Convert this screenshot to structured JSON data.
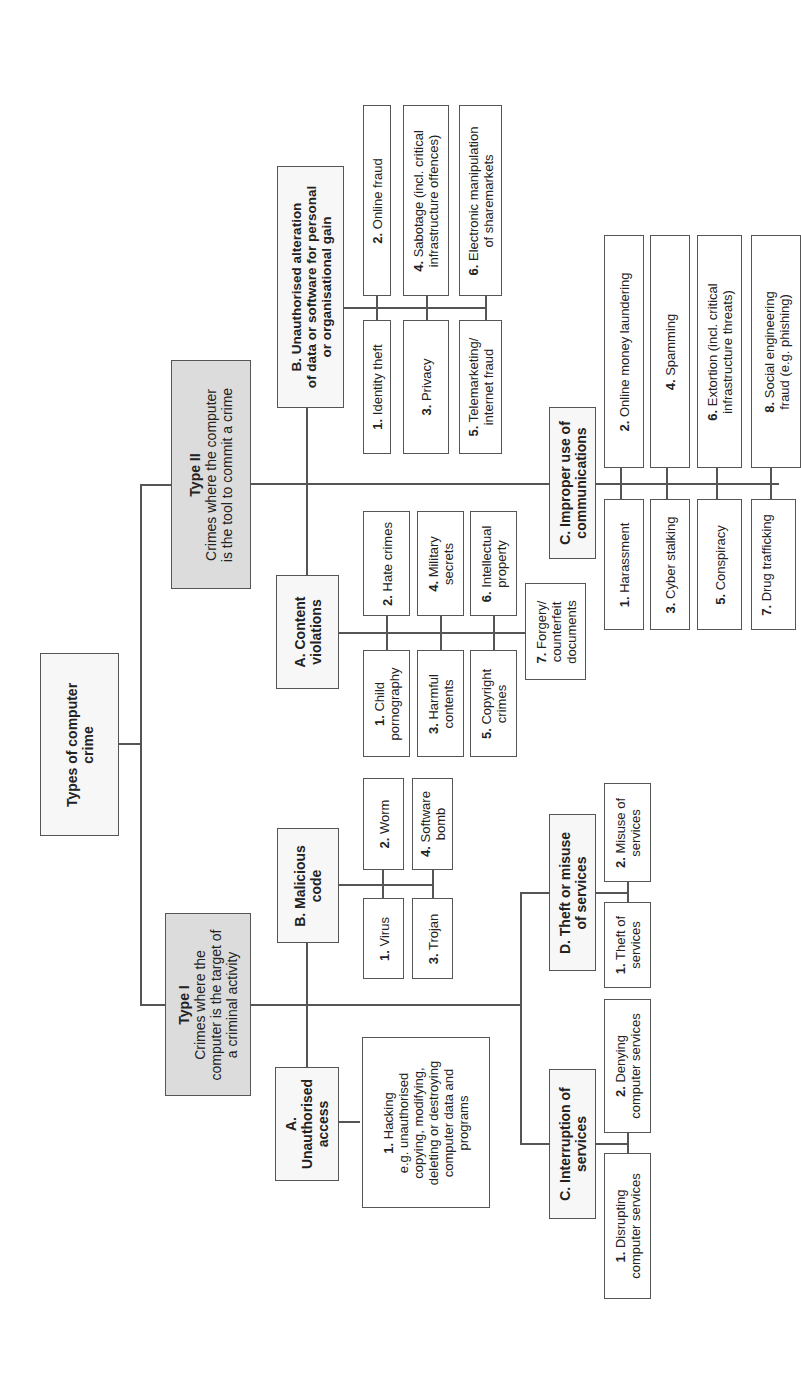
{
  "root": {
    "title": "Types of computer crime",
    "lines": [
      "Types of computer",
      "crime"
    ]
  },
  "type1": {
    "title": "Type I",
    "desc_lines": [
      "Crimes where the",
      "computer is the target of",
      "a criminal activity"
    ],
    "categories": {
      "A": {
        "lines": [
          "A.",
          "Unauthorised",
          "access"
        ],
        "items": [
          {
            "num": "1.",
            "lines": [
              "Hacking",
              "e.g. unauthorised",
              "copying, modifying,",
              "deleting or destroying",
              "computer data and",
              "programs"
            ]
          }
        ]
      },
      "B": {
        "lines": [
          "B. Malicious",
          "code"
        ],
        "items": [
          {
            "num": "1.",
            "lines": [
              "Virus"
            ]
          },
          {
            "num": "2.",
            "lines": [
              "Worm"
            ]
          },
          {
            "num": "3.",
            "lines": [
              "Trojan"
            ]
          },
          {
            "num": "4.",
            "lines": [
              "Software",
              "bomb"
            ]
          }
        ]
      },
      "C": {
        "lines": [
          "C. Interruption of",
          "services"
        ],
        "items": [
          {
            "num": "1.",
            "lines": [
              "Disrupting",
              "computer services"
            ]
          },
          {
            "num": "2.",
            "lines": [
              "Denying",
              "computer services"
            ]
          }
        ]
      },
      "D": {
        "lines": [
          "D. Theft or misuse",
          "of services"
        ],
        "items": [
          {
            "num": "1.",
            "lines": [
              "Theft of",
              "services"
            ]
          },
          {
            "num": "2.",
            "lines": [
              "Misuse of",
              "services"
            ]
          }
        ]
      }
    }
  },
  "type2": {
    "title": "Type II",
    "desc_lines": [
      "Crimes where the computer",
      "is the tool to commit a crime"
    ],
    "categories": {
      "A": {
        "lines": [
          "A. Content",
          "violations"
        ],
        "items": [
          {
            "num": "1.",
            "lines": [
              "Child",
              "pornography"
            ]
          },
          {
            "num": "2.",
            "lines": [
              "Hate crimes"
            ]
          },
          {
            "num": "3.",
            "lines": [
              "Harmful",
              "contents"
            ]
          },
          {
            "num": "4.",
            "lines": [
              "Military",
              "secrets"
            ]
          },
          {
            "num": "5.",
            "lines": [
              "Copyright",
              "crimes"
            ]
          },
          {
            "num": "6.",
            "lines": [
              "Intellectual",
              "property"
            ]
          },
          {
            "num": "7.",
            "lines": [
              "Forgery/",
              "counterfeit",
              "documents"
            ]
          }
        ]
      },
      "B": {
        "lines": [
          "B. Unauthorised alteration",
          "of data or software for personal",
          "or organisational gain"
        ],
        "items": [
          {
            "num": "1.",
            "lines": [
              "Identity theft"
            ]
          },
          {
            "num": "2.",
            "lines": [
              "Online fraud"
            ]
          },
          {
            "num": "3.",
            "lines": [
              "Privacy"
            ]
          },
          {
            "num": "4.",
            "lines": [
              "Sabotage (incl. critical",
              "infrastructure offences)"
            ]
          },
          {
            "num": "5.",
            "lines": [
              "Telemarketing/",
              "internet fraud"
            ]
          },
          {
            "num": "6.",
            "lines": [
              "Electronic manipulation",
              "of sharemarkets"
            ]
          }
        ]
      },
      "C": {
        "lines": [
          "C. Improper use of",
          "communications"
        ],
        "items": [
          {
            "num": "1.",
            "lines": [
              "Harassment"
            ]
          },
          {
            "num": "2.",
            "lines": [
              "Online money laundering"
            ]
          },
          {
            "num": "3.",
            "lines": [
              "Cyber stalking"
            ]
          },
          {
            "num": "4.",
            "lines": [
              "Spamming"
            ]
          },
          {
            "num": "5.",
            "lines": [
              "Conspiracy"
            ]
          },
          {
            "num": "6.",
            "lines": [
              "Extortion (incl. critical",
              "infrastructure threats)"
            ]
          },
          {
            "num": "7.",
            "lines": [
              "Drug trafficking"
            ]
          },
          {
            "num": "8.",
            "lines": [
              "Social engineering",
              "fraud (e.g. phishing)"
            ]
          }
        ]
      }
    }
  }
}
